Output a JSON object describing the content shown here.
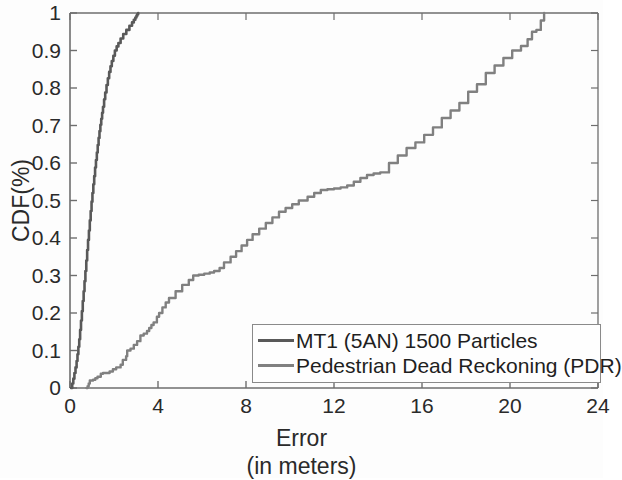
{
  "chart_data": {
    "type": "line",
    "title": "",
    "xlabel": "Error\n(in meters)",
    "xlabel_lines": [
      "Error",
      "(in meters)"
    ],
    "ylabel": "CDF(%)",
    "xlim": [
      0,
      24
    ],
    "ylim": [
      0,
      1
    ],
    "xticks": [
      0,
      4,
      8,
      12,
      16,
      20,
      24
    ],
    "xtick_labels": [
      "0",
      "4",
      "8",
      "12",
      "16",
      "20",
      "24"
    ],
    "yticks": [
      0,
      0.1,
      0.2,
      0.3,
      0.4,
      0.5,
      0.6,
      0.7,
      0.8,
      0.9,
      1
    ],
    "ytick_labels": [
      "0",
      "0.1",
      "0.2",
      "0.3",
      "0.4",
      "0.5",
      "0.6",
      "0.7",
      "0.8",
      "0.9",
      "1"
    ],
    "grid": false,
    "legend_position": "lower right",
    "series": [
      {
        "name": "MT1 (5AN) 1500 Particles",
        "color": "#595959",
        "x": [
          0.05,
          0.1,
          0.15,
          0.2,
          0.25,
          0.3,
          0.34,
          0.38,
          0.42,
          0.46,
          0.5,
          0.54,
          0.58,
          0.62,
          0.66,
          0.7,
          0.74,
          0.78,
          0.82,
          0.86,
          0.9,
          0.94,
          0.98,
          1.02,
          1.06,
          1.1,
          1.14,
          1.18,
          1.22,
          1.26,
          1.3,
          1.34,
          1.38,
          1.42,
          1.46,
          1.5,
          1.55,
          1.6,
          1.66,
          1.72,
          1.78,
          1.84,
          1.9,
          1.97,
          2.04,
          2.12,
          2.2,
          2.3,
          2.42,
          2.56,
          2.7,
          2.82,
          2.9,
          2.97,
          3.02,
          3.06,
          3.1
        ],
        "y": [
          0.0,
          0.012,
          0.025,
          0.04,
          0.055,
          0.072,
          0.09,
          0.11,
          0.13,
          0.155,
          0.18,
          0.205,
          0.232,
          0.258,
          0.285,
          0.312,
          0.34,
          0.368,
          0.395,
          0.42,
          0.447,
          0.472,
          0.497,
          0.52,
          0.543,
          0.565,
          0.588,
          0.608,
          0.628,
          0.648,
          0.667,
          0.685,
          0.702,
          0.718,
          0.734,
          0.75,
          0.77,
          0.788,
          0.808,
          0.826,
          0.843,
          0.858,
          0.872,
          0.886,
          0.9,
          0.911,
          0.92,
          0.932,
          0.944,
          0.955,
          0.966,
          0.975,
          0.982,
          0.988,
          0.993,
          0.997,
          1.0
        ]
      },
      {
        "name": "Pedestrian Dead Reckoning (PDR)",
        "color": "#808080",
        "x": [
          0.75,
          0.8,
          0.85,
          0.9,
          1.05,
          1.15,
          1.25,
          1.4,
          1.5,
          1.8,
          1.95,
          2.1,
          2.3,
          2.4,
          2.55,
          2.6,
          2.75,
          2.9,
          3.05,
          3.2,
          3.35,
          3.5,
          3.6,
          3.7,
          3.8,
          3.95,
          4.05,
          4.2,
          4.35,
          4.5,
          4.8,
          5.1,
          5.4,
          5.6,
          5.85,
          6.1,
          6.35,
          6.55,
          6.8,
          7.0,
          7.3,
          7.55,
          7.8,
          8.05,
          8.3,
          8.6,
          8.9,
          9.2,
          9.5,
          9.8,
          10.1,
          10.4,
          10.8,
          11.1,
          11.4,
          11.7,
          12.0,
          12.3,
          12.6,
          12.9,
          13.2,
          13.5,
          13.8,
          14.1,
          14.5,
          14.9,
          15.3,
          15.7,
          16.1,
          16.5,
          16.9,
          17.3,
          17.7,
          18.1,
          18.5,
          18.9,
          19.3,
          19.7,
          20.1,
          20.5,
          20.8,
          21.0,
          21.2,
          21.4,
          21.55
        ],
        "y": [
          0.0,
          0.005,
          0.012,
          0.02,
          0.022,
          0.026,
          0.03,
          0.038,
          0.04,
          0.044,
          0.05,
          0.055,
          0.062,
          0.075,
          0.085,
          0.1,
          0.105,
          0.115,
          0.125,
          0.14,
          0.145,
          0.152,
          0.16,
          0.168,
          0.175,
          0.19,
          0.2,
          0.215,
          0.228,
          0.24,
          0.258,
          0.275,
          0.288,
          0.3,
          0.302,
          0.305,
          0.308,
          0.312,
          0.32,
          0.335,
          0.35,
          0.365,
          0.38,
          0.395,
          0.41,
          0.425,
          0.44,
          0.455,
          0.47,
          0.48,
          0.49,
          0.5,
          0.51,
          0.52,
          0.528,
          0.53,
          0.532,
          0.535,
          0.54,
          0.55,
          0.56,
          0.568,
          0.572,
          0.575,
          0.6,
          0.62,
          0.64,
          0.655,
          0.675,
          0.695,
          0.72,
          0.74,
          0.76,
          0.79,
          0.81,
          0.84,
          0.86,
          0.88,
          0.9,
          0.912,
          0.93,
          0.95,
          0.955,
          0.98,
          1.0
        ]
      }
    ]
  },
  "axes": {
    "y_title": "CDF(%)",
    "x_title_line1": "Error",
    "x_title_line2": "(in meters)"
  },
  "legend": {
    "entries": [
      {
        "label": "MT1 (5AN) 1500 Particles",
        "color": "#595959"
      },
      {
        "label": "Pedestrian Dead Reckoning (PDR)",
        "color": "#808080"
      }
    ]
  },
  "style": {
    "axis_color": "#6e6e6e",
    "text_color": "#2a2a2a",
    "background": "#fdfdfd"
  }
}
